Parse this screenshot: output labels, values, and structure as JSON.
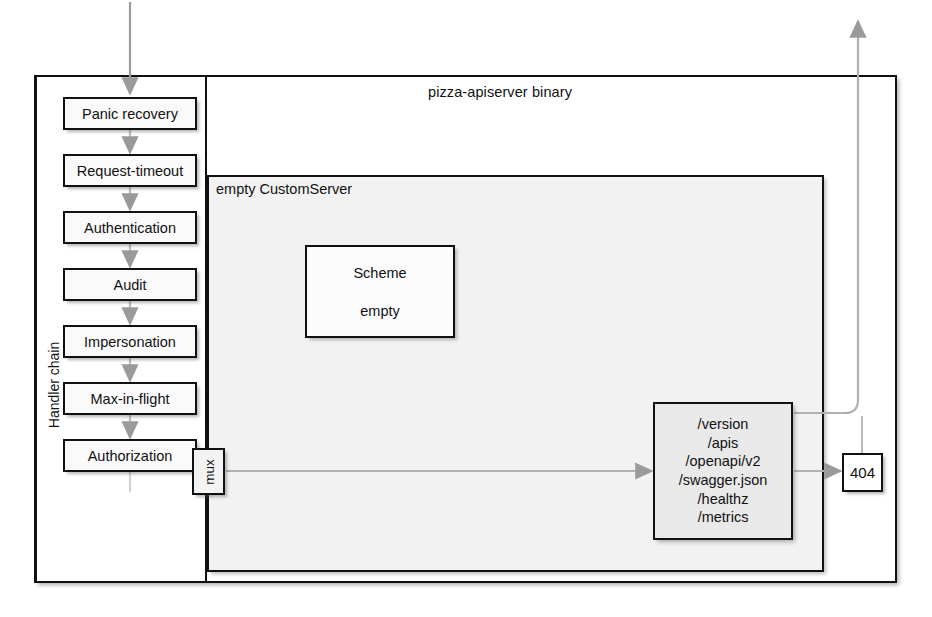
{
  "diagram": {
    "title": "pizza-apiserver binary",
    "inner_container_label": "empty CustomServer",
    "handler_chain_label": "Handler chain",
    "handlers": [
      {
        "label": "Panic recovery"
      },
      {
        "label": "Request-timeout"
      },
      {
        "label": "Authentication"
      },
      {
        "label": "Audit"
      },
      {
        "label": "Impersonation"
      },
      {
        "label": "Max-in-flight"
      },
      {
        "label": "Authorization"
      }
    ],
    "mux": {
      "label": "mux"
    },
    "scheme": {
      "title": "Scheme",
      "body": "empty"
    },
    "endpoints": {
      "routes": [
        "/version",
        "/apis",
        "/openapi/v2",
        "/swagger.json",
        "/healthz",
        "/metrics"
      ]
    },
    "fallback": {
      "label": "404"
    },
    "colors": {
      "stroke": "#111111",
      "arrow": "#9a9a9a",
      "panel_fill": "#f2f2f2",
      "endpoints_fill": "#e9e9e9",
      "page_bg": "#ffffff"
    }
  }
}
